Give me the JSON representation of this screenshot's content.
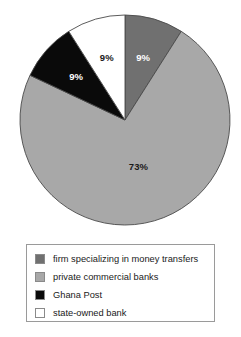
{
  "chart_data": {
    "type": "pie",
    "title": "",
    "subtitle": "",
    "xlabel": "",
    "ylabel": "",
    "grid": false,
    "legend_position": "bottom",
    "start_angle_deg": 0,
    "direction": "clockwise",
    "categories": [
      "firm specializing in money transfers",
      "private commercial banks",
      "Ghana Post",
      "state-owned bank"
    ],
    "values": [
      9,
      73,
      9,
      9
    ],
    "value_labels": [
      "9%",
      "73%",
      "9%",
      "9%"
    ],
    "slice_colors": [
      "#707070",
      "#a8a8a8",
      "#0a0a0a",
      "#ffffff"
    ],
    "slice_label_colors": [
      "#ffffff",
      "#1a1a1a",
      "#ffffff",
      "#1a1a1a"
    ],
    "slices": [
      {
        "name": "firm specializing in money transfers",
        "value": 9,
        "label": "9%",
        "color": "#707070",
        "label_color": "#ffffff"
      },
      {
        "name": "private commercial banks",
        "value": 73,
        "label": "73%",
        "color": "#a8a8a8",
        "label_color": "#1a1a1a"
      },
      {
        "name": "Ghana Post",
        "value": 9,
        "label": "9%",
        "color": "#0a0a0a",
        "label_color": "#ffffff"
      },
      {
        "name": "state-owned bank",
        "value": 9,
        "label": "9%",
        "color": "#ffffff",
        "label_color": "#1a1a1a"
      }
    ]
  },
  "legend": {
    "items": [
      {
        "label": "firm specializing in money transfers",
        "color": "#707070"
      },
      {
        "label": "private commercial banks",
        "color": "#a8a8a8"
      },
      {
        "label": "Ghana Post",
        "color": "#0a0a0a"
      },
      {
        "label": "state-owned bank",
        "color": "#ffffff"
      }
    ]
  }
}
